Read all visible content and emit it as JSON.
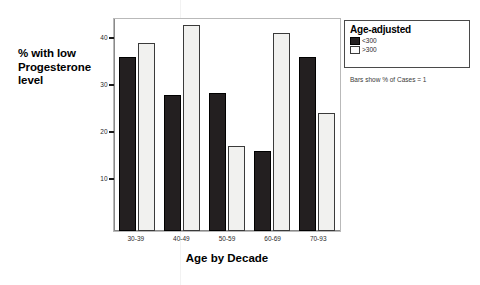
{
  "chart_data": {
    "type": "bar",
    "title": "",
    "xlabel": "Age by Decade",
    "ylabel": "% with low Progesterone level",
    "categories": [
      "30-39",
      "40-49",
      "50-59",
      "60-69",
      "70-93"
    ],
    "series": [
      {
        "name": "<300",
        "color": "#231f20",
        "values": [
          37,
          28.8,
          29.2,
          17,
          37
        ]
      },
      {
        "name": ">300",
        "color": "#f1f1ef",
        "values": [
          40,
          43.8,
          18,
          42,
          25
        ]
      }
    ],
    "ylim": [
      0,
      45
    ],
    "yticks": [
      10,
      20,
      30,
      40
    ],
    "ytick_labels": [
      "10",
      "20",
      "30",
      "40"
    ],
    "grid": false,
    "legend_position": "right",
    "legend_title": "Age-adjusted",
    "annotation": "Bars show % of Cases = 1"
  },
  "axes": {
    "y_title_lines": [
      "% with low",
      "Progesterone",
      "level"
    ],
    "x_title": "Age by Decade"
  },
  "legend": {
    "title": "Age-adjusted",
    "entries": [
      {
        "label": "<300",
        "swatch": "dark"
      },
      {
        "label": ">300",
        "swatch": "light"
      }
    ]
  },
  "footnote": "Bars show % of Cases = 1"
}
